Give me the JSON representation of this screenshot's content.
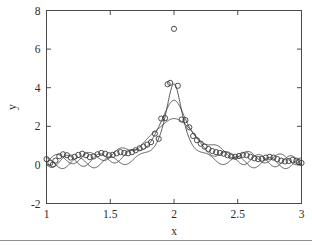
{
  "chart_data": {
    "type": "scatter",
    "title": "",
    "xlabel": "x",
    "ylabel": "y",
    "xlim": [
      1,
      3
    ],
    "ylim": [
      -2,
      8
    ],
    "xticks": [
      1,
      1.5,
      2,
      2.5,
      3
    ],
    "xticklabels": [
      "1",
      "1.5",
      "2",
      "2.5",
      "3"
    ],
    "yticks": [
      -2,
      0,
      2,
      4,
      6,
      8
    ],
    "yticklabels": [
      "-2",
      "0",
      "2",
      "4",
      "6",
      "8"
    ],
    "grid": false,
    "legend": null,
    "marker": "open-circle",
    "scatter": {
      "name": "observed data",
      "points": [
        [
          1.0,
          0.3
        ],
        [
          1.03,
          0.1
        ],
        [
          1.05,
          0.02
        ],
        [
          1.07,
          0.22
        ],
        [
          1.1,
          0.45
        ],
        [
          1.13,
          0.55
        ],
        [
          1.16,
          0.5
        ],
        [
          1.19,
          0.38
        ],
        [
          1.22,
          0.42
        ],
        [
          1.25,
          0.52
        ],
        [
          1.28,
          0.58
        ],
        [
          1.31,
          0.5
        ],
        [
          1.34,
          0.4
        ],
        [
          1.37,
          0.44
        ],
        [
          1.4,
          0.55
        ],
        [
          1.43,
          0.62
        ],
        [
          1.46,
          0.58
        ],
        [
          1.49,
          0.5
        ],
        [
          1.52,
          0.52
        ],
        [
          1.55,
          0.6
        ],
        [
          1.58,
          0.66
        ],
        [
          1.61,
          0.62
        ],
        [
          1.64,
          0.6
        ],
        [
          1.67,
          0.66
        ],
        [
          1.7,
          0.76
        ],
        [
          1.73,
          0.86
        ],
        [
          1.76,
          0.95
        ],
        [
          1.79,
          1.05
        ],
        [
          1.82,
          1.18
        ],
        [
          1.85,
          1.62
        ],
        [
          1.88,
          1.35
        ],
        [
          1.9,
          2.4
        ],
        [
          1.93,
          2.42
        ],
        [
          1.95,
          4.18
        ],
        [
          1.97,
          4.25
        ],
        [
          2.0,
          7.05
        ],
        [
          2.03,
          4.1
        ],
        [
          2.06,
          2.35
        ],
        [
          2.09,
          2.32
        ],
        [
          2.12,
          1.95
        ],
        [
          2.15,
          1.5
        ],
        [
          2.18,
          1.28
        ],
        [
          2.21,
          1.1
        ],
        [
          2.24,
          0.95
        ],
        [
          2.27,
          0.82
        ],
        [
          2.3,
          0.72
        ],
        [
          2.33,
          0.66
        ],
        [
          2.36,
          0.62
        ],
        [
          2.39,
          0.58
        ],
        [
          2.42,
          0.5
        ],
        [
          2.45,
          0.44
        ],
        [
          2.48,
          0.42
        ],
        [
          2.51,
          0.46
        ],
        [
          2.54,
          0.52
        ],
        [
          2.57,
          0.5
        ],
        [
          2.6,
          0.42
        ],
        [
          2.63,
          0.34
        ],
        [
          2.66,
          0.3
        ],
        [
          2.69,
          0.32
        ],
        [
          2.72,
          0.38
        ],
        [
          2.75,
          0.42
        ],
        [
          2.78,
          0.38
        ],
        [
          2.81,
          0.3
        ],
        [
          2.84,
          0.22
        ],
        [
          2.87,
          0.18
        ],
        [
          2.9,
          0.2
        ],
        [
          2.93,
          0.26
        ],
        [
          2.96,
          0.22
        ],
        [
          2.98,
          0.14
        ],
        [
          3.0,
          0.1
        ]
      ]
    },
    "series": [
      {
        "name": "narrow fit",
        "type": "line",
        "peak_x": 2.0,
        "peak_y": 4.2,
        "half_width": 0.085,
        "baseline": 0.05,
        "ripple_amplitude": 0.28,
        "ripple_period": 0.25,
        "ripple_phase": 0.0
      },
      {
        "name": "medium fit",
        "type": "line",
        "peak_x": 2.0,
        "peak_y": 3.35,
        "half_width": 0.14,
        "baseline": 0.1,
        "ripple_amplitude": 0.3,
        "ripple_period": 0.25,
        "ripple_phase": 2.09
      },
      {
        "name": "broad fit",
        "type": "line",
        "peak_x": 2.0,
        "peak_y": 2.4,
        "half_width": 0.22,
        "baseline": 0.15,
        "ripple_amplitude": 0.26,
        "ripple_period": 0.25,
        "ripple_phase": 4.19
      }
    ]
  },
  "axes": {
    "x_title": "x",
    "y_title": "y"
  }
}
